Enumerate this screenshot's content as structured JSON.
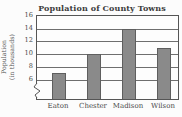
{
  "chart_data": {
    "type": "bar",
    "title": "Population of County Towns",
    "ylabel_lines": [
      "Population",
      "(in thousands)"
    ],
    "categories": [
      "Eaton",
      "Chester",
      "Madison",
      "Wilson"
    ],
    "values": [
      7,
      10,
      14,
      11
    ],
    "yticks": [
      16,
      14,
      12,
      10,
      8,
      6
    ],
    "ylim": [
      6,
      16
    ],
    "axis_break": true,
    "grid": true,
    "legend": "none",
    "colors": {
      "bar_fill": "#8a8a8a",
      "bar_border": "#5e5e5e",
      "axis": "#555555",
      "grid": "#6e6e6e",
      "text": "#3d3d3d",
      "background": "#fcfcfc"
    }
  }
}
